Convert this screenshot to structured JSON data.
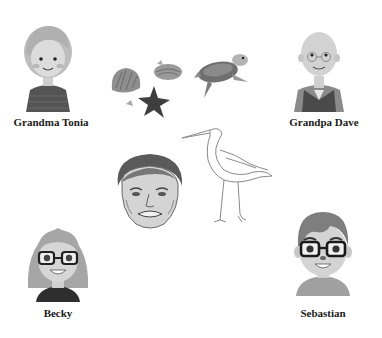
{
  "people": [
    {
      "id": "grandma",
      "name": "Grandma Tonia"
    },
    {
      "id": "grandpa",
      "name": "Grandpa Dave"
    },
    {
      "id": "becky",
      "name": "Becky"
    },
    {
      "id": "sebastian",
      "name": "Sebastian"
    }
  ],
  "center_items": [
    {
      "id": "seashells",
      "icon": "seashells-starfish-icon"
    },
    {
      "id": "turtle",
      "icon": "sea-turtle-icon"
    },
    {
      "id": "egret",
      "icon": "egret-bird-icon"
    },
    {
      "id": "portrait",
      "icon": "man-portrait-sketch"
    }
  ],
  "colors": {
    "background": "#ffffff",
    "label": "#1a1a1a",
    "hair_light": "#b5b5b5",
    "hair_dark": "#7a7a7a",
    "skin": "#d6d6d6",
    "shirt_dark": "#4a4a4a"
  }
}
